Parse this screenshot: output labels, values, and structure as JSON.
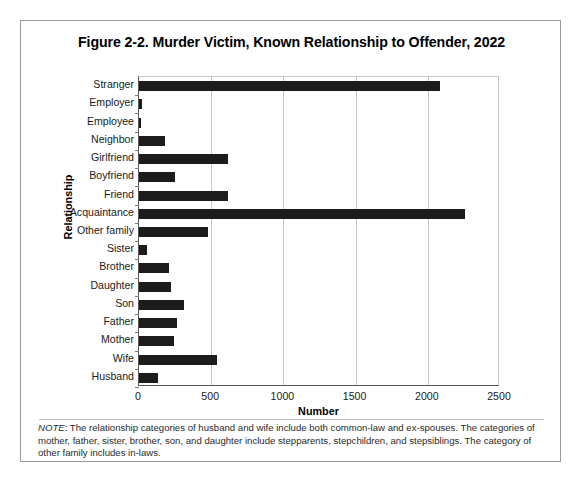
{
  "figure": {
    "title": "Figure 2-2. Murder Victim, Known Relationship to Offender, 2022",
    "note_lead": "NOTE",
    "note_text": ": The relationship categories of husband and wife include both common-law and ex-spouses. The categories of mother, father, sister, brother, son, and daughter include stepparents, stepchildren, and stepsiblings. The category of other family includes in-laws.",
    "frame_color": "#9a9a9a",
    "bar_color": "#1c1c1c"
  },
  "chart_data": {
    "type": "bar",
    "orientation": "horizontal",
    "title": "Figure 2-2. Murder Victim, Known Relationship to Offender, 2022",
    "xlabel": "Number",
    "ylabel": "Relationship",
    "categories": [
      "Stranger",
      "Employer",
      "Employee",
      "Neighbor",
      "Girlfriend",
      "Boyfriend",
      "Friend",
      "Acquaintance",
      "Other family",
      "Sister",
      "Brother",
      "Daughter",
      "Son",
      "Father",
      "Mother",
      "Wife",
      "Husband"
    ],
    "values": [
      2085,
      18,
      16,
      183,
      617,
      249,
      617,
      2258,
      478,
      55,
      208,
      222,
      312,
      263,
      242,
      540,
      132
    ],
    "xlim": [
      0,
      2500
    ],
    "xticks": [
      0,
      500,
      1000,
      1500,
      2000,
      2500
    ],
    "xtick_labels": [
      "0",
      "500",
      "1000",
      "1500",
      "2000",
      "2500"
    ],
    "grid": true,
    "grid_axis": "x",
    "legend": null
  }
}
